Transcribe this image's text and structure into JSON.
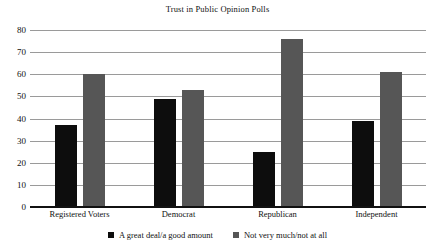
{
  "chart_data": {
    "type": "bar",
    "title": "Trust in Public Opinion Polls",
    "xlabel": "",
    "ylabel": "",
    "ylim": [
      0,
      80
    ],
    "yticks": [
      0,
      10,
      20,
      30,
      40,
      50,
      60,
      70,
      80
    ],
    "ytick_labels": [
      "0",
      "10",
      "20",
      "30",
      "40",
      "50",
      "60",
      "70",
      "80"
    ],
    "grid": true,
    "legend_position": "bottom",
    "categories": [
      "Registered Voters",
      "Democrat",
      "Republican",
      "Independent"
    ],
    "series": [
      {
        "name": "A great deal/a good amount",
        "color": "#0d0d0d",
        "values": [
          37,
          49,
          25,
          39
        ]
      },
      {
        "name": "Not very much/not at all",
        "color": "#565656",
        "values": [
          60,
          53,
          76,
          61
        ]
      }
    ]
  },
  "legend": {
    "items": [
      {
        "label": "A great deal/a good amount"
      },
      {
        "label": "Not very much/not at all"
      }
    ]
  }
}
